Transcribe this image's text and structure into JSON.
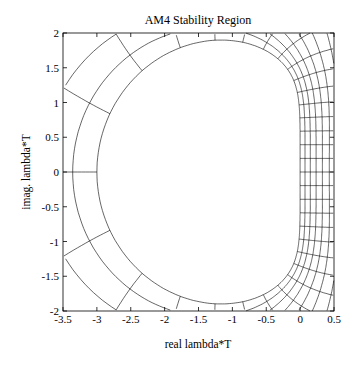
{
  "chart_data": {
    "type": "line",
    "title": "AM4 Stability Region",
    "xlabel": "real lambda*T",
    "ylabel": "imag. lambda*T",
    "xlim": [
      -3.5,
      0.5
    ],
    "ylim": [
      -2,
      2
    ],
    "xticks": [
      -3.5,
      -3,
      -2.5,
      -2,
      -1.5,
      -1,
      -0.5,
      0,
      0.5
    ],
    "xtick_labels": [
      "-3.5",
      "-3",
      "-2.5",
      "-2",
      "-1.5",
      "-1",
      "-0.5",
      "0",
      "0.5"
    ],
    "yticks": [
      -2,
      -1.5,
      -1,
      -0.5,
      0,
      0.5,
      1,
      1.5,
      2
    ],
    "ytick_labels": [
      "-2",
      "-1.5",
      "-1",
      "-0.5",
      "0",
      "0.5",
      "1",
      "1.5",
      "2"
    ],
    "grid": false,
    "legend": null,
    "mesh": {
      "radii": [
        1.0,
        0.93,
        0.86,
        0.79,
        0.72,
        0.65,
        0.58,
        0.51,
        0.44,
        0.37,
        0.3
      ],
      "ray_count": 32,
      "line_color": "#000000"
    }
  },
  "colors": {
    "background": "#ffffff",
    "axes": "#000000",
    "mesh": "#000000"
  }
}
